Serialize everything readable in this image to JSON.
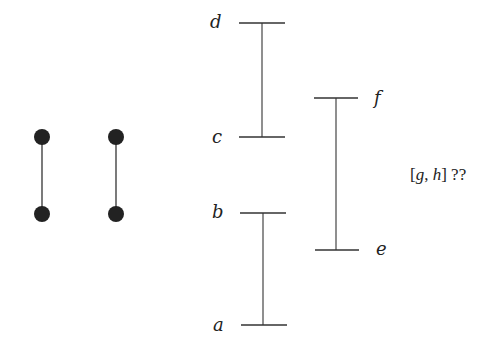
{
  "diagram": {
    "dumbbells": [
      {
        "x": 42,
        "y_top": 137,
        "y_bottom": 214
      },
      {
        "x": 116,
        "y_top": 137,
        "y_bottom": 214
      }
    ],
    "intervals": [
      {
        "name": "cd",
        "low_label": "c",
        "high_label": "d",
        "x": 262,
        "y_low": 137,
        "y_high": 23
      },
      {
        "name": "ab",
        "low_label": "a",
        "high_label": "b",
        "x": 262,
        "y_low": 325,
        "y_high": 213
      },
      {
        "name": "ef",
        "low_label": "e",
        "high_label": "f",
        "x": 336,
        "y_low": 250,
        "y_high": 98
      }
    ],
    "labels": {
      "a": "a",
      "b": "b",
      "c": "c",
      "d": "d",
      "e": "e",
      "f": "f"
    },
    "question": {
      "open": "[",
      "g": "g",
      "comma": ", ",
      "h": "h",
      "close": "]",
      "suffix": " ??"
    },
    "colors": {
      "stroke": "#333333",
      "dot": "#222222",
      "background": "#ffffff"
    }
  }
}
